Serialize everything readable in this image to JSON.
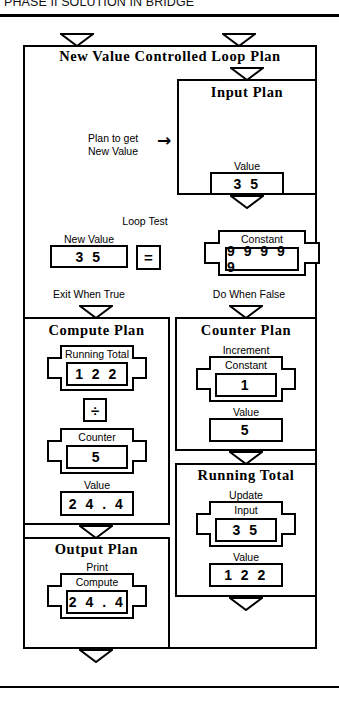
{
  "page": {
    "header_text": "E PHASE II SOLUTION IN BRIDGE",
    "divider": "horizontal-rule"
  },
  "diagram": {
    "type": "structured-program-plan",
    "root_plan": {
      "title": "New Value Controlled Loop Plan",
      "note_label": "Plan to get\nNew Value",
      "arrow_glyph": "→",
      "input_plan": {
        "title": "Input Plan",
        "value_box": {
          "caption": "Value",
          "value": "3 5"
        }
      },
      "loop_test": {
        "label": "Loop Test",
        "left_operand": {
          "caption": "New Value",
          "value": "3 5"
        },
        "operator": "=",
        "right_operand": {
          "caption": "Constant",
          "value": "9 9 9 9 9"
        },
        "true_branch_label": "Exit When True",
        "false_branch_label": "Do When False"
      }
    },
    "compute_plan": {
      "title": "Compute Plan",
      "operand_1": {
        "caption": "Running Total",
        "value": "1 2 2"
      },
      "operator": "÷",
      "operand_2": {
        "caption": "Counter",
        "value": "5"
      },
      "result": {
        "caption": "Value",
        "value": "2 4 . 4"
      }
    },
    "output_plan": {
      "title": "Output Plan",
      "action": "Print",
      "source": {
        "caption": "Compute",
        "value": "2 4 . 4"
      }
    },
    "counter_plan": {
      "title": "Counter Plan",
      "action": "Increment",
      "operand": {
        "caption": "Constant",
        "value": "1"
      },
      "result": {
        "caption": "Value",
        "value": "5"
      }
    },
    "running_total_plan": {
      "title": "Running Total",
      "action": "Update",
      "operand": {
        "caption": "Input",
        "value": "3 5"
      },
      "result": {
        "caption": "Value",
        "value": "1 2 2"
      }
    }
  },
  "style": {
    "ink": "#000000",
    "paper": "#ffffff"
  }
}
